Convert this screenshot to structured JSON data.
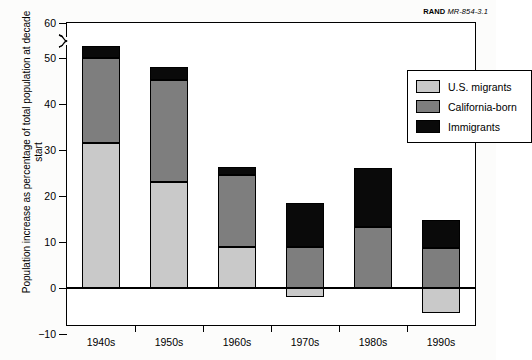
{
  "credit": {
    "org": "RAND",
    "figure_id": "MR-854-3.1"
  },
  "chart_data": {
    "type": "bar",
    "stacked": true,
    "title": "",
    "subtitle": "",
    "xlabel": "",
    "ylabel": "Population increase as percentage of total population at decade start",
    "categories": [
      "1940s",
      "1950s",
      "1960s",
      "1970s",
      "1980s",
      "1990s"
    ],
    "series": [
      {
        "name": "U.S. migrants",
        "color": "#c9c9c9",
        "values": [
          31.5,
          23.0,
          9.0,
          -2.0,
          0.0,
          -5.5
        ]
      },
      {
        "name": "California-born",
        "color": "#7e7e7e",
        "values": [
          18.5,
          22.3,
          15.5,
          9.0,
          13.3,
          8.8
        ]
      },
      {
        "name": "Immigrants",
        "color": "#0a0a0a",
        "values": [
          3.5,
          2.8,
          1.8,
          9.5,
          12.7,
          6.0
        ]
      }
    ],
    "totals_positive": [
      53.5,
      48.0,
      26.3,
      18.5,
      26.0,
      14.8
    ],
    "ylim": [
      -10,
      60
    ],
    "yticks": [
      -10,
      0,
      10,
      20,
      30,
      40,
      50,
      60
    ],
    "ytick_labels": [
      "−10",
      "0",
      "10",
      "20",
      "30",
      "40",
      "50",
      "60"
    ],
    "axis_break": {
      "present": true,
      "between": [
        50,
        60
      ]
    },
    "grid": false,
    "legend_position": "top-right",
    "legend_entries": [
      "U.S. migrants",
      "California-born",
      "Immigrants"
    ]
  }
}
